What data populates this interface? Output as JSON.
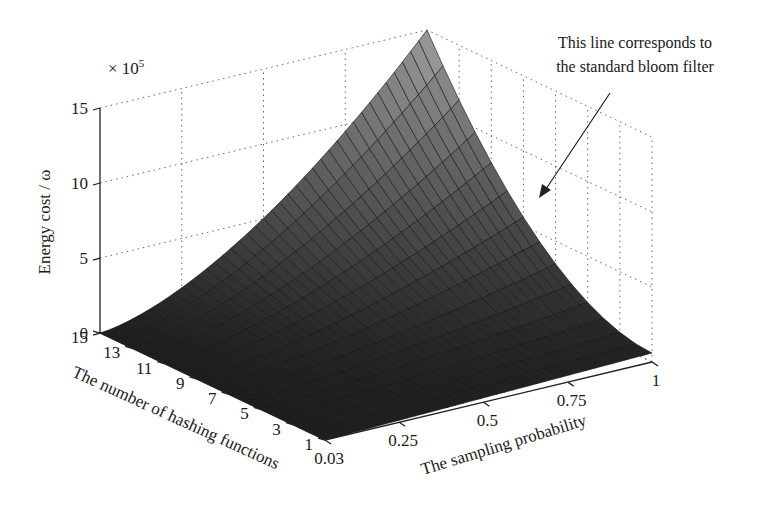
{
  "chart_data": {
    "type": "surface3d",
    "title": "",
    "xlabel": "The sampling probability",
    "ylabel": "The number of hashing functions",
    "zlabel": "Energy cost / ω",
    "z_multiplier": "× 10^5",
    "z_multiplier_base": "× 10",
    "z_multiplier_exp": "5",
    "x_ticks": [
      "0.03",
      "0.25",
      "0.5",
      "0.75",
      "1"
    ],
    "x_range": [
      0.03,
      1
    ],
    "y_ticks": [
      "1",
      "3",
      "5",
      "7",
      "9",
      "11",
      "13",
      "15"
    ],
    "y_range": [
      1,
      15
    ],
    "z_ticks": [
      "0",
      "5",
      "10",
      "15"
    ],
    "zlim": [
      0,
      15
    ],
    "grid": true,
    "colormap": "gray",
    "surface_samples": {
      "description": "Energy cost (x10^5) grows with both sampling probability and number of hash functions; peak at p=1, k=15",
      "corners": [
        {
          "p": 0.03,
          "k": 1,
          "z": 0.0
        },
        {
          "p": 0.03,
          "k": 15,
          "z": 0.05
        },
        {
          "p": 1,
          "k": 1,
          "z": 0.6
        },
        {
          "p": 1,
          "k": 15,
          "z": 15.0
        }
      ]
    },
    "annotation": {
      "line1": "This line corresponds to",
      "line2": "the standard bloom filter",
      "target": "edge at sampling probability = 1"
    }
  }
}
